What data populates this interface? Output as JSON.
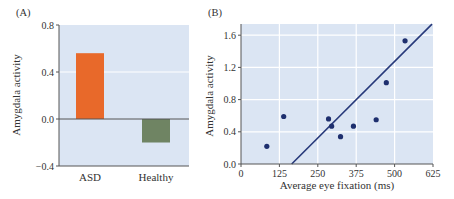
{
  "colors": {
    "plot_bg": "#dbe5f3",
    "grid": "#ffffff",
    "axis": "#555555",
    "asd_bar": "#e8692a",
    "healthy_bar": "#6f8463",
    "point": "#1e2f6e",
    "line": "#27397a"
  },
  "chart_data": [
    {
      "panel": "(A)",
      "type": "bar",
      "categories": [
        "ASD",
        "Healthy"
      ],
      "values": [
        0.56,
        -0.2
      ],
      "title": "",
      "xlabel": "",
      "ylabel": "Amygdala activity",
      "ylim": [
        -0.4,
        0.8
      ],
      "yticks": [
        "0.8",
        "0.4",
        "0.0",
        "−0.4"
      ],
      "grid": true
    },
    {
      "panel": "(B)",
      "type": "scatter",
      "title": "",
      "xlabel": "Average eye fixation (ms)",
      "ylabel": "Amygdala activity",
      "xlim": [
        0,
        625
      ],
      "ylim": [
        0,
        1.75
      ],
      "xticks": [
        "0",
        "125",
        "250",
        "375",
        "500",
        "625"
      ],
      "yticks": [
        "0.0",
        "0.4",
        "0.8",
        "1.2",
        "1.6"
      ],
      "grid": true,
      "points": [
        {
          "x": 84,
          "y": 0.22
        },
        {
          "x": 139,
          "y": 0.59
        },
        {
          "x": 285,
          "y": 0.56
        },
        {
          "x": 295,
          "y": 0.47
        },
        {
          "x": 324,
          "y": 0.34
        },
        {
          "x": 366,
          "y": 0.47
        },
        {
          "x": 440,
          "y": 0.55
        },
        {
          "x": 473,
          "y": 1.01
        },
        {
          "x": 534,
          "y": 1.53
        }
      ],
      "regression_line": {
        "x0": 165,
        "y0": 0.0,
        "x1": 625,
        "y1": 1.75
      }
    }
  ]
}
